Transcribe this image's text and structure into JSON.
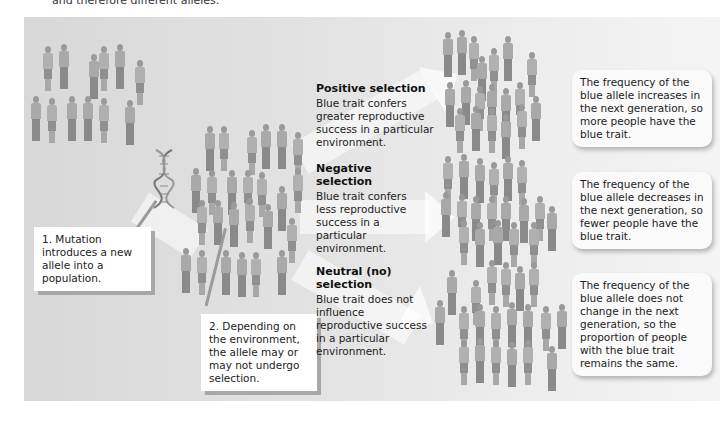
{
  "caption": {
    "top_fragment": "and therefore different alleles."
  },
  "steps": {
    "step1": "1. Mutation introduces a new allele into a population.",
    "step2": "2. Depending on the environment, the allele may or may not undergo selection."
  },
  "selection": [
    {
      "title": "Positive selection",
      "description": "Blue trait confers greater reproductive success in a particular environment.",
      "result": "The frequency of the blue allele increases in the next generation, so more people have the blue trait."
    },
    {
      "title": "Negative selection",
      "description": "Blue trait confers less reproductive success in a particular environment.",
      "result": "The frequency of the blue allele decreases in the next generation, so fewer people have the blue trait."
    },
    {
      "title": "Neutral (no) selection",
      "description": "Blue trait does not influence reproductive success in a particular environment.",
      "result": "The frequency of the blue allele does not change in the next generation, so the proportion of people with the blue trait remains the same."
    }
  ],
  "icons": {
    "dna": "dna-helix-icon",
    "people": "person-figure-icon",
    "arrow": "arrow-right-icon"
  },
  "colors": {
    "panel_bg": "#e2e2e2",
    "box_bg": "#ffffff",
    "shadow": "#a8a8a8",
    "figure": "#9a9a9a"
  }
}
